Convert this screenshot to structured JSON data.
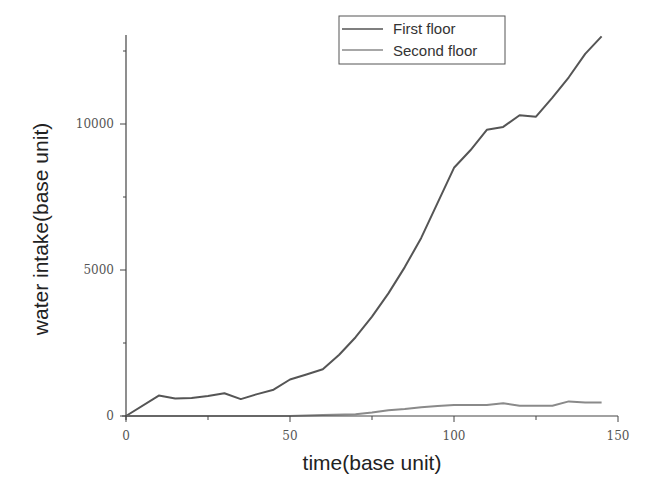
{
  "chart_data": {
    "type": "line",
    "title": "",
    "xlabel": "time(base unit)",
    "ylabel": "water intake(base unit)",
    "xlim": [
      0,
      150
    ],
    "ylim": [
      0,
      13000
    ],
    "xticks": [
      0,
      50,
      100,
      150
    ],
    "xtick_labels": [
      "0",
      "50",
      "100",
      "150"
    ],
    "yticks": [
      0,
      5000,
      10000
    ],
    "ytick_labels": [
      "0",
      "5000",
      "10000"
    ],
    "grid": false,
    "legend_position": "top-right",
    "series": [
      {
        "name": "First floor",
        "color": "#555555",
        "x": [
          0,
          10,
          15,
          20,
          25,
          30,
          35,
          40,
          45,
          50,
          55,
          60,
          65,
          70,
          75,
          80,
          85,
          90,
          95,
          100,
          105,
          110,
          115,
          120,
          125,
          130,
          135,
          140,
          145
        ],
        "values": [
          0,
          700,
          600,
          620,
          680,
          780,
          580,
          750,
          900,
          1250,
          1420,
          1600,
          2100,
          2700,
          3400,
          4200,
          5100,
          6100,
          7300,
          8500,
          9100,
          9800,
          9900,
          10300,
          10250,
          10900,
          11600,
          12400,
          13000
        ]
      },
      {
        "name": "Second floor",
        "color": "#8a8a8a",
        "x": [
          0,
          50,
          60,
          70,
          75,
          80,
          85,
          90,
          95,
          100,
          105,
          110,
          115,
          120,
          125,
          130,
          135,
          140,
          145
        ],
        "values": [
          0,
          0,
          30,
          60,
          120,
          200,
          240,
          300,
          340,
          380,
          380,
          380,
          440,
          350,
          350,
          350,
          500,
          460,
          460
        ]
      }
    ]
  },
  "legend": {
    "items": [
      {
        "label": "First floor"
      },
      {
        "label": "Second floor"
      }
    ]
  }
}
